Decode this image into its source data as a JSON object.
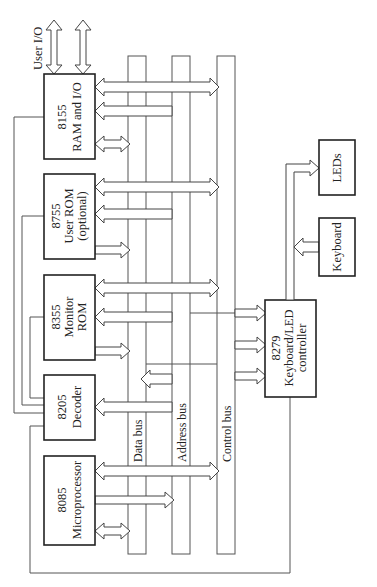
{
  "diagram": {
    "orientation": "rotated 90deg counter-clockwise",
    "blocks": [
      {
        "id": "8155",
        "line1": "8155",
        "line2": "RAM and I/O"
      },
      {
        "id": "8755",
        "line1": "8755",
        "line2": "User ROM",
        "line3": "(optional)"
      },
      {
        "id": "8355",
        "line1": "8355",
        "line2": "Monitor",
        "line3": "ROM"
      },
      {
        "id": "8205",
        "line1": "8205",
        "line2": "Decoder"
      },
      {
        "id": "8085",
        "line1": "8085",
        "line2": "Microprocessor"
      },
      {
        "id": "8279",
        "line1": "8279",
        "line2": "Keyboard/LED",
        "line3": "controller"
      },
      {
        "id": "keyboard",
        "line1": "Keyboard"
      },
      {
        "id": "leds",
        "line1": "LEDs"
      }
    ],
    "buses": [
      {
        "id": "data",
        "label": "Data bus"
      },
      {
        "id": "address",
        "label": "Address bus"
      },
      {
        "id": "control",
        "label": "Control bus"
      }
    ],
    "external": {
      "user_io": "User I/O"
    },
    "colors": {
      "stroke": "#222222",
      "bus": "#555555",
      "background": "#ffffff"
    }
  }
}
